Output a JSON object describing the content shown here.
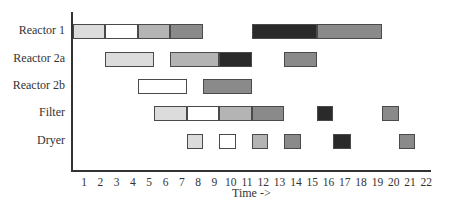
{
  "chart_data": {
    "type": "gantt",
    "title": "",
    "xlabel": "Time ->",
    "ylabel": "",
    "x_ticks": [
      1,
      2,
      3,
      4,
      5,
      6,
      7,
      8,
      9,
      10,
      11,
      12,
      13,
      14,
      15,
      16,
      17,
      18,
      19,
      20,
      21,
      22
    ],
    "categories": [
      "Reactor 1",
      "Reactor 2a",
      "Reactor 2b",
      "Filter",
      "Dryer"
    ],
    "tasks": [
      {
        "unit": "Reactor 1",
        "start": 0.3,
        "end": 2.3,
        "shade": "light"
      },
      {
        "unit": "Reactor 1",
        "start": 2.3,
        "end": 4.3,
        "shade": "white"
      },
      {
        "unit": "Reactor 1",
        "start": 4.3,
        "end": 6.3,
        "shade": "mid-light"
      },
      {
        "unit": "Reactor 1",
        "start": 6.3,
        "end": 8.3,
        "shade": "mid"
      },
      {
        "unit": "Reactor 1",
        "start": 11.3,
        "end": 15.3,
        "shade": "dark"
      },
      {
        "unit": "Reactor 1",
        "start": 15.3,
        "end": 19.3,
        "shade": "mid"
      },
      {
        "unit": "Reactor 2a",
        "start": 2.3,
        "end": 5.3,
        "shade": "light"
      },
      {
        "unit": "Reactor 2a",
        "start": 6.3,
        "end": 9.3,
        "shade": "mid-light"
      },
      {
        "unit": "Reactor 2a",
        "start": 9.3,
        "end": 11.3,
        "shade": "dark"
      },
      {
        "unit": "Reactor 2a",
        "start": 13.3,
        "end": 15.3,
        "shade": "mid"
      },
      {
        "unit": "Reactor 2b",
        "start": 4.3,
        "end": 7.3,
        "shade": "white"
      },
      {
        "unit": "Reactor 2b",
        "start": 8.3,
        "end": 11.3,
        "shade": "mid"
      },
      {
        "unit": "Filter",
        "start": 5.3,
        "end": 7.3,
        "shade": "light"
      },
      {
        "unit": "Filter",
        "start": 7.3,
        "end": 9.3,
        "shade": "white"
      },
      {
        "unit": "Filter",
        "start": 9.3,
        "end": 11.3,
        "shade": "mid-light"
      },
      {
        "unit": "Filter",
        "start": 11.3,
        "end": 13.3,
        "shade": "mid"
      },
      {
        "unit": "Filter",
        "start": 15.3,
        "end": 16.3,
        "shade": "dark"
      },
      {
        "unit": "Filter",
        "start": 19.3,
        "end": 20.3,
        "shade": "mid"
      },
      {
        "unit": "Dryer",
        "start": 7.3,
        "end": 8.3,
        "shade": "light"
      },
      {
        "unit": "Dryer",
        "start": 9.3,
        "end": 10.3,
        "shade": "white"
      },
      {
        "unit": "Dryer",
        "start": 11.3,
        "end": 12.3,
        "shade": "mid-light"
      },
      {
        "unit": "Dryer",
        "start": 13.3,
        "end": 14.3,
        "shade": "mid"
      },
      {
        "unit": "Dryer",
        "start": 16.3,
        "end": 17.4,
        "shade": "dark"
      },
      {
        "unit": "Dryer",
        "start": 20.3,
        "end": 21.3,
        "shade": "mid"
      }
    ],
    "shades": {
      "white": "#ffffff",
      "light": "#dcdcdc",
      "mid-light": "#b4b4b4",
      "mid": "#8a8a8a",
      "dark": "#2a2a2a"
    },
    "legend": null,
    "grid": false
  }
}
